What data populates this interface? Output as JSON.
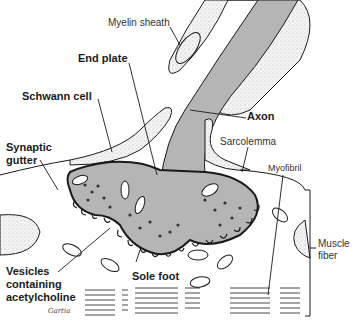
{
  "diagram": {
    "labels": {
      "myelin_sheath": "Myelin sheath",
      "end_plate": "End plate",
      "schwann_cell": "Schwann cell",
      "axon": "Axon",
      "synaptic_gutter_line1": "Synaptic",
      "synaptic_gutter_line2": "gutter",
      "sarcolemma": "Sarcolemma",
      "myofibril": "Myofibril",
      "muscle_fiber_line1": "Muscle",
      "muscle_fiber_line2": "fiber",
      "vesicles_line1": "Vesicles",
      "vesicles_line2": "containing",
      "vesicles_line3": "acetylcholine",
      "sole_foot": "Sole foot"
    },
    "signature": "Gartia",
    "colors": {
      "axon_fill": "#b5b5b5",
      "stipple": "#e8e8e8",
      "line": "#1a1a1a"
    }
  }
}
